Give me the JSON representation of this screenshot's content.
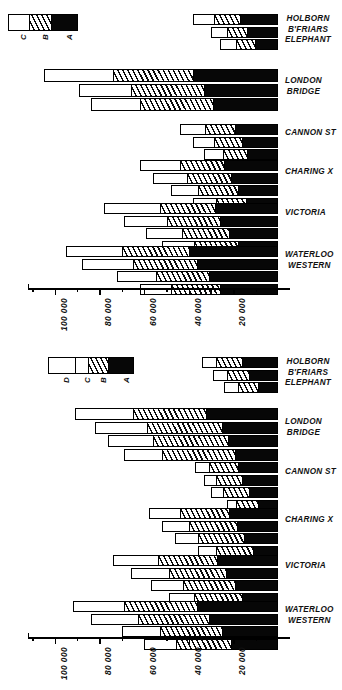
{
  "figure": {
    "title": "",
    "axis_note": "Passengers, inverted scale"
  },
  "axis": {
    "ticks": [
      "100 000",
      "80 000",
      "60 000",
      "40 000",
      "20 000"
    ],
    "tick_values": [
      100000,
      80000,
      60000,
      40000,
      20000
    ],
    "minor_step": 10000,
    "range_max": 112000,
    "range_min": 0,
    "direction": "descending-left-to-right"
  },
  "legend_top": {
    "segments": [
      {
        "key": "C",
        "label": "C"
      },
      {
        "key": "B",
        "label": "B"
      },
      {
        "key": "A",
        "label": "A"
      }
    ]
  },
  "legend_bottom": {
    "segments": [
      {
        "key": "D",
        "label": "D"
      },
      {
        "key": "C",
        "label": "C"
      },
      {
        "key": "B",
        "label": "B"
      },
      {
        "key": "A",
        "label": "A"
      }
    ]
  },
  "stations": {
    "holborn": [
      "HOLBORN",
      "B'FRIARS",
      "ELEPHANT"
    ],
    "london_bridge": [
      "LONDON",
      "BRIDGE"
    ],
    "cannon": [
      "CANNON ST"
    ],
    "charing": [
      "CHARING X"
    ],
    "victoria": [
      "VICTORIA"
    ],
    "waterloo": [
      "WATERLOO",
      "WESTERN"
    ]
  },
  "chart_data": [
    {
      "type": "bar",
      "orientation": "horizontal",
      "stacked": true,
      "id": "upper-chart",
      "title": "",
      "xlabel": "",
      "ylabel": "",
      "xlim": [
        112000,
        0
      ],
      "xticks": [
        100000,
        80000,
        60000,
        40000,
        20000
      ],
      "xticklabels": [
        "100 000",
        "80 000",
        "60 000",
        "40 000",
        "20 000"
      ],
      "grid": false,
      "legend_position": "top-left",
      "series": [
        {
          "name": "A",
          "fill": "black"
        },
        {
          "name": "B",
          "fill": "hatched"
        },
        {
          "name": "C",
          "fill": "white"
        }
      ],
      "groups": [
        {
          "category": "HOLBORN B'FRIARS ELEPHANT",
          "bars": [
            {
              "total": 38000,
              "segments": {
                "A": 17000,
                "B": 12000,
                "C": 9000
              }
            },
            {
              "total": 30000,
              "segments": {
                "A": 14000,
                "B": 9000,
                "C": 7000
              }
            },
            {
              "total": 26000,
              "segments": {
                "A": 10000,
                "B": 9000,
                "C": 7000
              }
            }
          ]
        },
        {
          "category": "LONDON BRIDGE",
          "bars": [
            {
              "total": 105000,
              "segments": {
                "A": 38000,
                "B": 36000,
                "C": 31000
              }
            },
            {
              "total": 89000,
              "segments": {
                "A": 33000,
                "B": 33000,
                "C": 23000
              }
            },
            {
              "total": 84000,
              "segments": {
                "A": 29000,
                "B": 33000,
                "C": 22000
              }
            }
          ]
        },
        {
          "category": "CANNON ST",
          "bars": [
            {
              "total": 44000,
              "segments": {
                "A": 19000,
                "B": 14000,
                "C": 11000
              }
            },
            {
              "total": 38000,
              "segments": {
                "A": 16000,
                "B": 13000,
                "C": 9000
              }
            },
            {
              "total": 33000,
              "segments": {
                "A": 14000,
                "B": 11000,
                "C": 8000
              }
            }
          ]
        },
        {
          "category": "CHARING X",
          "bars": [
            {
              "total": 62000,
              "segments": {
                "A": 24000,
                "B": 20000,
                "C": 18000
              }
            },
            {
              "total": 56000,
              "segments": {
                "A": 21000,
                "B": 20000,
                "C": 15000
              }
            },
            {
              "total": 48000,
              "segments": {
                "A": 18000,
                "B": 18000,
                "C": 12000
              }
            },
            {
              "total": 38000,
              "segments": {
                "A": 14000,
                "B": 14000,
                "C": 10000
              }
            }
          ]
        },
        {
          "category": "VICTORIA",
          "bars": [
            {
              "total": 78000,
              "segments": {
                "A": 28000,
                "B": 25000,
                "C": 25000
              }
            },
            {
              "total": 69000,
              "segments": {
                "A": 26000,
                "B": 24000,
                "C": 19000
              }
            },
            {
              "total": 59000,
              "segments": {
                "A": 22000,
                "B": 21000,
                "C": 16000
              }
            },
            {
              "total": 52000,
              "segments": {
                "A": 18000,
                "B": 20000,
                "C": 14000
              }
            }
          ]
        },
        {
          "category": "WATERLOO WESTERN",
          "bars": [
            {
              "total": 95000,
              "segments": {
                "A": 40000,
                "B": 30000,
                "C": 25000
              }
            },
            {
              "total": 88000,
              "segments": {
                "A": 36000,
                "B": 29000,
                "C": 23000
              }
            },
            {
              "total": 72000,
              "segments": {
                "A": 31000,
                "B": 24000,
                "C": 17000
              }
            },
            {
              "total": 62000,
              "segments": {
                "A": 26000,
                "B": 22000,
                "C": 14000
              }
            }
          ]
        }
      ]
    },
    {
      "type": "bar",
      "orientation": "horizontal",
      "stacked": true,
      "id": "lower-chart",
      "title": "",
      "xlabel": "",
      "ylabel": "",
      "xlim": [
        112000,
        0
      ],
      "xticks": [
        100000,
        80000,
        60000,
        40000,
        20000
      ],
      "xticklabels": [
        "100 000",
        "80 000",
        "60 000",
        "40 000",
        "20 000"
      ],
      "grid": false,
      "legend_position": "top-left",
      "series": [
        {
          "name": "A",
          "fill": "black"
        },
        {
          "name": "B",
          "fill": "hatched"
        },
        {
          "name": "C",
          "fill": "white"
        },
        {
          "name": "D",
          "fill": "white"
        }
      ],
      "groups": [
        {
          "category": "HOLBORN B'FRIARS ELEPHANT",
          "bars": [
            {
              "total": 34000,
              "segments": {
                "A": 16000,
                "B": 12000,
                "C": 6000
              }
            },
            {
              "total": 29000,
              "segments": {
                "A": 13000,
                "B": 10000,
                "C": 6000
              }
            },
            {
              "total": 24000,
              "segments": {
                "A": 9000,
                "B": 9000,
                "C": 6000
              }
            }
          ]
        },
        {
          "category": "LONDON BRIDGE",
          "bars": [
            {
              "total": 91000,
              "segments": {
                "A": 32000,
                "B": 33000,
                "C": 26000
              }
            },
            {
              "total": 82000,
              "segments": {
                "A": 25000,
                "B": 34000,
                "C": 23000
              }
            },
            {
              "total": 76000,
              "segments": {
                "A": 22000,
                "B": 34000,
                "C": 20000
              }
            },
            {
              "total": 69000,
              "segments": {
                "A": 19000,
                "B": 33000,
                "C": 17000
              }
            }
          ]
        },
        {
          "category": "CANNON ST",
          "bars": [
            {
              "total": 37000,
              "segments": {
                "A": 18000,
                "B": 13000,
                "C": 6000
              }
            },
            {
              "total": 33000,
              "segments": {
                "A": 16000,
                "B": 12000,
                "C": 5000
              }
            },
            {
              "total": 30000,
              "segments": {
                "A": 13000,
                "B": 12000,
                "C": 5000
              }
            },
            {
              "total": 23000,
              "segments": {
                "A": 9000,
                "B": 10000,
                "C": 4000
              }
            }
          ]
        },
        {
          "category": "CHARING X",
          "bars": [
            {
              "total": 58000,
              "segments": {
                "A": 22000,
                "B": 22000,
                "C": 14000
              }
            },
            {
              "total": 52000,
              "segments": {
                "A": 18000,
                "B": 22000,
                "C": 12000
              }
            },
            {
              "total": 46000,
              "segments": {
                "A": 15000,
                "B": 21000,
                "C": 10000
              }
            },
            {
              "total": 36000,
              "segments": {
                "A": 11000,
                "B": 17000,
                "C": 8000
              }
            }
          ]
        },
        {
          "category": "VICTORIA",
          "bars": [
            {
              "total": 74000,
              "segments": {
                "A": 27000,
                "B": 27000,
                "C": 20000
              }
            },
            {
              "total": 66000,
              "segments": {
                "A": 23000,
                "B": 26000,
                "C": 17000
              }
            },
            {
              "total": 57000,
              "segments": {
                "A": 19000,
                "B": 24000,
                "C": 14000
              }
            },
            {
              "total": 49000,
              "segments": {
                "A": 16000,
                "B": 22000,
                "C": 11000
              }
            }
          ]
        },
        {
          "category": "WATERLOO WESTERN",
          "bars": [
            {
              "total": 92000,
              "segments": {
                "A": 36000,
                "B": 33000,
                "C": 23000
              }
            },
            {
              "total": 84000,
              "segments": {
                "A": 31000,
                "B": 32000,
                "C": 21000
              }
            },
            {
              "total": 70000,
              "segments": {
                "A": 25000,
                "B": 28000,
                "C": 17000
              }
            },
            {
              "total": 60000,
              "segments": {
                "A": 21000,
                "B": 25000,
                "C": 14000
              }
            }
          ]
        }
      ]
    }
  ]
}
